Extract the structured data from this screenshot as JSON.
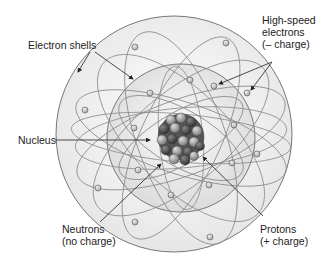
{
  "diagram": {
    "type": "atom-model",
    "labels": {
      "electron_shells": "Electron shells",
      "high_speed_electrons": [
        "High-speed",
        "electrons",
        "(– charge)"
      ],
      "nucleus": "Nucleus",
      "neutrons": [
        "Neutrons",
        "(no charge)"
      ],
      "protons": [
        "Protons",
        "(+ charge)"
      ]
    },
    "colors": {
      "outer_shell_fill": "#eeeeee",
      "inner_shell_fill": "#e2e2e2",
      "orbit_stroke": "#888888",
      "proton": "#9a9a9a",
      "neutron": "#555555",
      "electron": "#cfcfcf"
    }
  }
}
